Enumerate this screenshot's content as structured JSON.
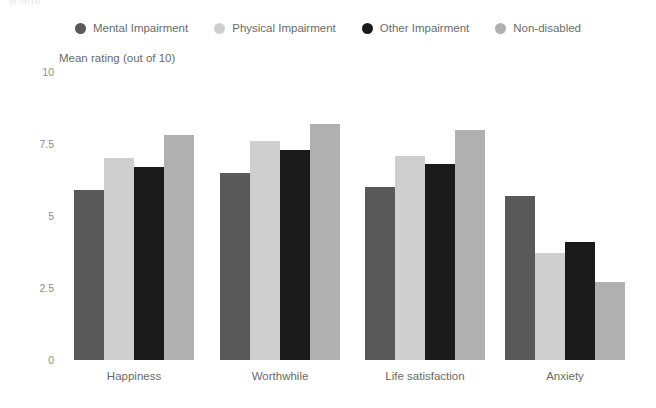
{
  "top_caption": "in 2019",
  "axis_title": "Mean rating (out of 10)",
  "legend": {
    "items": [
      {
        "label": "Mental Impairment",
        "color": "#595959"
      },
      {
        "label": "Physical Impairment",
        "color": "#cfcfcf"
      },
      {
        "label": "Other Impairment",
        "color": "#1a1a1a"
      },
      {
        "label": "Non-disabled",
        "color": "#b0b0b0"
      }
    ]
  },
  "y_axis": {
    "ticks": [
      "10",
      "7.5",
      "5",
      "2.5",
      "0"
    ],
    "tick_values": [
      10,
      7.5,
      5,
      2.5,
      0
    ]
  },
  "chart_data": {
    "type": "bar",
    "title": "",
    "subtitle": "",
    "xlabel": "",
    "ylabel": "Mean rating (out of 10)",
    "ylim": [
      0,
      10
    ],
    "grid": false,
    "legend_position": "top-center",
    "categories": [
      "Happiness",
      "Worthwhile",
      "Life satisfaction",
      "Anxiety"
    ],
    "series": [
      {
        "name": "Mental Impairment",
        "color": "#595959",
        "values": [
          5.9,
          6.5,
          6.0,
          5.7
        ]
      },
      {
        "name": "Physical Impairment",
        "color": "#cfcfcf",
        "values": [
          7.0,
          7.6,
          7.1,
          3.7
        ]
      },
      {
        "name": "Other Impairment",
        "color": "#1a1a1a",
        "values": [
          6.7,
          7.3,
          6.8,
          4.1
        ]
      },
      {
        "name": "Non-disabled",
        "color": "#b0b0b0",
        "values": [
          7.8,
          8.2,
          8.0,
          2.7
        ]
      }
    ]
  }
}
